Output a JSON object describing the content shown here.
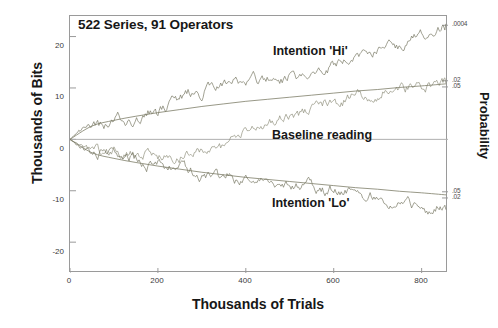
{
  "chart_data": {
    "type": "line",
    "title": "522 Series, 91 Operators",
    "xlabel": "Thousands of Trials",
    "ylabel": "Thousands of Bits",
    "ylabel_right": "Probability",
    "xlim": [
      0,
      860
    ],
    "ylim": [
      -26,
      24
    ],
    "xticks": [
      0,
      200,
      400,
      600,
      800
    ],
    "xticklabels": [
      "0",
      "200",
      "400",
      "600",
      "800"
    ],
    "yticks": [
      20,
      10,
      0,
      -10,
      -20
    ],
    "yticklabels": [
      "20",
      "10",
      "0",
      "-10",
      "-20"
    ],
    "right_axis_ticks": [
      {
        "label": ".0004",
        "value": 22.2
      },
      {
        "label": ".02",
        "value": 11.4
      },
      {
        "label": ".05",
        "value": 10.2
      },
      {
        "label": ".05",
        "value": -10.2
      },
      {
        "label": ".02",
        "value": -11.4
      }
    ],
    "grid": false,
    "legend_position": "inline-annotations",
    "annotations": [
      {
        "text": "Intention 'Hi'",
        "x": 430,
        "y": 16.5
      },
      {
        "text": "Baseline reading",
        "x": 428,
        "y": 2.0
      },
      {
        "text": "Intention 'Lo'",
        "x": 428,
        "y": -11.5
      }
    ],
    "series": [
      {
        "name": "Intention 'Hi'",
        "color": "#6f6f5a",
        "style": "noisy-random-walk",
        "x": [
          0,
          20,
          40,
          60,
          80,
          100,
          120,
          140,
          160,
          180,
          200,
          220,
          240,
          260,
          280,
          300,
          320,
          340,
          360,
          380,
          400,
          420,
          440,
          460,
          480,
          500,
          520,
          540,
          560,
          580,
          600,
          620,
          640,
          660,
          680,
          700,
          720,
          740,
          760,
          780,
          800,
          820,
          840,
          855
        ],
        "y": [
          0,
          1.6,
          2.1,
          3.4,
          2.6,
          3.7,
          4.2,
          3.4,
          4.4,
          5.3,
          4.6,
          6.3,
          7.7,
          8.6,
          9.4,
          9.1,
          10.2,
          10.9,
          10.3,
          11.2,
          10.8,
          11.6,
          11.2,
          12.1,
          11.5,
          12.4,
          11.9,
          12.8,
          12.2,
          13.0,
          14.6,
          15.9,
          15.1,
          16.6,
          17.5,
          17.0,
          18.2,
          17.6,
          18.9,
          19.8,
          20.4,
          21.1,
          21.8,
          22.4
        ]
      },
      {
        "name": "Baseline reading",
        "color": "#8a8a76",
        "style": "noisy-random-walk",
        "x": [
          0,
          20,
          40,
          60,
          80,
          100,
          120,
          140,
          160,
          180,
          200,
          220,
          240,
          260,
          280,
          300,
          320,
          340,
          360,
          380,
          400,
          420,
          440,
          460,
          480,
          500,
          520,
          540,
          560,
          580,
          600,
          620,
          640,
          660,
          680,
          700,
          720,
          740,
          760,
          780,
          800,
          820,
          840,
          855
        ],
        "y": [
          0,
          -1.1,
          -2.0,
          -1.4,
          -2.6,
          -2.0,
          -3.1,
          -2.4,
          -3.3,
          -2.7,
          -3.6,
          -3.0,
          -3.8,
          -3.2,
          -2.6,
          -1.9,
          -2.5,
          -1.6,
          -0.8,
          0.2,
          1.1,
          2.0,
          2.9,
          3.8,
          4.6,
          5.3,
          4.7,
          5.6,
          6.4,
          7.1,
          6.5,
          7.3,
          8.0,
          8.7,
          8.2,
          9.0,
          9.6,
          9.2,
          9.8,
          10.3,
          10.0,
          10.5,
          10.8,
          11.0
        ]
      },
      {
        "name": "Intention 'Lo'",
        "color": "#6f6f5a",
        "style": "noisy-random-walk",
        "x": [
          0,
          20,
          40,
          60,
          80,
          100,
          120,
          140,
          160,
          180,
          200,
          220,
          240,
          260,
          280,
          300,
          320,
          340,
          360,
          380,
          400,
          420,
          440,
          460,
          480,
          500,
          520,
          540,
          560,
          580,
          600,
          620,
          640,
          660,
          680,
          700,
          720,
          740,
          760,
          780,
          800,
          820,
          840,
          855
        ],
        "y": [
          0,
          -1.3,
          -2.4,
          -3.0,
          -2.2,
          -3.1,
          -4.0,
          -3.3,
          -4.3,
          -5.1,
          -4.4,
          -5.4,
          -6.2,
          -5.5,
          -6.4,
          -7.2,
          -6.6,
          -7.5,
          -7.0,
          -7.9,
          -7.3,
          -8.2,
          -7.6,
          -8.5,
          -9.2,
          -8.6,
          -9.4,
          -8.8,
          -9.6,
          -10.3,
          -9.7,
          -10.5,
          -9.9,
          -10.7,
          -11.4,
          -10.8,
          -11.6,
          -12.3,
          -11.7,
          -12.5,
          -13.2,
          -13.8,
          -12.9,
          -13.6
        ]
      },
      {
        "name": "upper-significance-envelope",
        "color": "#7d7d68",
        "style": "smooth-parabolic",
        "x": [
          0,
          50,
          100,
          150,
          200,
          250,
          300,
          350,
          400,
          450,
          500,
          550,
          600,
          650,
          700,
          750,
          800,
          855
        ],
        "y": [
          0,
          2.6,
          3.7,
          4.5,
          5.2,
          5.8,
          6.4,
          6.9,
          7.4,
          7.8,
          8.2,
          8.6,
          9.0,
          9.4,
          9.7,
          10.1,
          10.4,
          10.8
        ]
      },
      {
        "name": "lower-significance-envelope",
        "color": "#7d7d68",
        "style": "smooth-parabolic",
        "x": [
          0,
          50,
          100,
          150,
          200,
          250,
          300,
          350,
          400,
          450,
          500,
          550,
          600,
          650,
          700,
          750,
          800,
          855
        ],
        "y": [
          0,
          -2.6,
          -3.7,
          -4.5,
          -5.2,
          -5.8,
          -6.4,
          -6.9,
          -7.4,
          -7.8,
          -8.2,
          -8.6,
          -9.0,
          -9.4,
          -9.7,
          -10.1,
          -10.4,
          -10.8
        ]
      }
    ],
    "zero_line": {
      "value": 0,
      "color": "#b0b0b0"
    }
  }
}
